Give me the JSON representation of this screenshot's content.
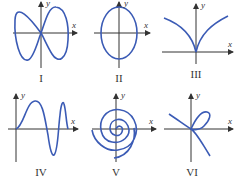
{
  "figure": {
    "colors": {
      "curve": "#3b5bb5",
      "axis": "#333333"
    },
    "axis_labels": {
      "x": "x",
      "y": "y"
    },
    "panels": [
      {
        "id": "I",
        "label": "I",
        "description": "figure-eight (lemniscate-like) curve crossing at origin"
      },
      {
        "id": "II",
        "label": "II",
        "description": "vertical ellipse centered at origin"
      },
      {
        "id": "III",
        "label": "III",
        "description": "cusp at origin opening upward"
      },
      {
        "id": "IV",
        "label": "IV",
        "description": "oscillating wave with increasing frequency"
      },
      {
        "id": "V",
        "label": "V",
        "description": "spiral outward from origin"
      },
      {
        "id": "VI",
        "label": "VI",
        "description": "curve with a loop crossing itself at origin"
      }
    ]
  }
}
